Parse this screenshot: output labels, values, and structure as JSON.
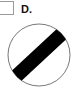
{
  "option": {
    "label": "D.",
    "checked": false
  },
  "sign": {
    "icon": "national-speed-limit-sign-icon",
    "description": "White circle with black diagonal stripe",
    "colors": {
      "background": "#ffffff",
      "outline": "#555555",
      "stripe": "#000000"
    }
  }
}
